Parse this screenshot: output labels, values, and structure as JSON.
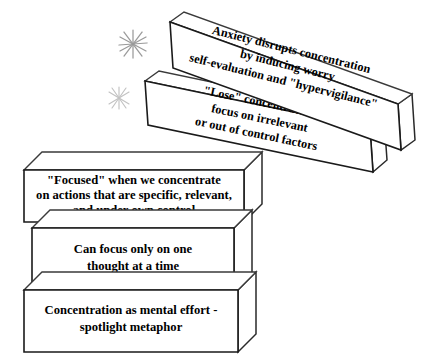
{
  "diagram": {
    "type": "stacked-3d-blocks",
    "background_color": "#ffffff",
    "outline_color": "#1a1a1a",
    "text_color": "#000000",
    "sparkle_color": "#9a9a9a"
  },
  "blocks": [
    {
      "id": "block-anxiety-disrupts",
      "name": "anxiety-disrupts-concentration-block",
      "order": 1,
      "position": "top",
      "tilted": true,
      "rotation_degrees": 14,
      "lines": [
        "Anxiety disrupts concentration",
        "by inducing worry",
        "self-evaluation and \"hypervigilance\""
      ]
    },
    {
      "id": "block-lose-concentration",
      "name": "lose-concentration-block",
      "order": 2,
      "position": "second",
      "tilted": true,
      "rotation_degrees": 14,
      "lines": [
        "\"Lose\" concentration -",
        "focus on irrelevant",
        "or out of control factors"
      ]
    },
    {
      "id": "block-focused",
      "name": "focused-when-we-concentrate-block",
      "order": 3,
      "position": "third",
      "tilted": false,
      "rotation_degrees": 0,
      "lines": [
        "\"Focused\" when we concentrate",
        "on actions that are specific, relevant,",
        "and under own control"
      ]
    },
    {
      "id": "block-one-thought",
      "name": "can-focus-only-on-one-thought-block",
      "order": 4,
      "position": "fourth",
      "tilted": false,
      "rotation_degrees": 0,
      "lines": [
        "Can focus only on one",
        "thought at a time"
      ]
    },
    {
      "id": "block-spotlight",
      "name": "concentration-as-mental-effort-block",
      "order": 5,
      "position": "bottom",
      "tilted": false,
      "rotation_degrees": 0,
      "lines": [
        "Concentration as mental effort -",
        "spotlight metaphor"
      ]
    }
  ],
  "sparkles": [
    {
      "id": "sparkle-upper",
      "name": "sparkle-upper",
      "rays": 8
    },
    {
      "id": "sparkle-lower",
      "name": "sparkle-lower",
      "rays": 8
    }
  ]
}
